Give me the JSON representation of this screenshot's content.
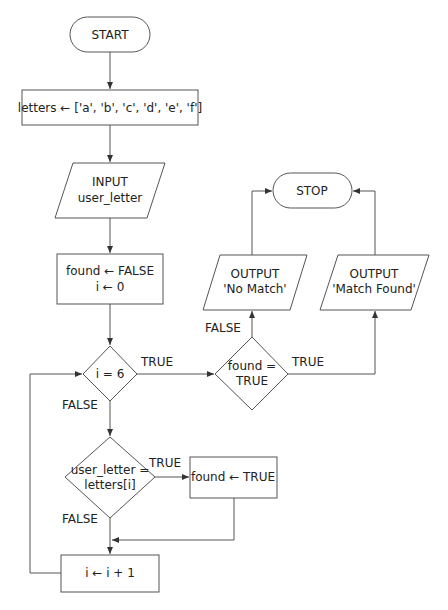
{
  "diagram": {
    "type": "flowchart",
    "nodes": {
      "start": {
        "kind": "terminator",
        "label": "START"
      },
      "init_letters": {
        "kind": "process",
        "label": "letters ← ['a', 'b', 'c', 'd', 'e', 'f']"
      },
      "input": {
        "kind": "io",
        "line1": "INPUT",
        "line2": "user_letter"
      },
      "init_vars": {
        "kind": "process",
        "line1": "found ← FALSE",
        "line2": "i ← 0"
      },
      "cond_i": {
        "kind": "decision",
        "label": "i = 6"
      },
      "cond_match": {
        "kind": "decision",
        "line1": "user_letter =",
        "line2": "letters[i]"
      },
      "set_found": {
        "kind": "process",
        "label": "found ← TRUE"
      },
      "increment": {
        "kind": "process",
        "label": "i ← i + 1"
      },
      "cond_found": {
        "kind": "decision",
        "line1": "found =",
        "line2": "TRUE"
      },
      "out_nomatch": {
        "kind": "io",
        "line1": "OUTPUT",
        "line2": "'No Match'"
      },
      "out_match": {
        "kind": "io",
        "line1": "OUTPUT",
        "line2": "'Match Found'"
      },
      "stop": {
        "kind": "terminator",
        "label": "STOP"
      }
    },
    "edge_labels": {
      "cond_i_true": "TRUE",
      "cond_i_false": "FALSE",
      "cond_match_true": "TRUE",
      "cond_match_false": "FALSE",
      "cond_found_true": "TRUE",
      "cond_found_false": "FALSE"
    },
    "colors": {
      "stroke": "#555555",
      "text": "#222222",
      "background": "#ffffff"
    }
  }
}
